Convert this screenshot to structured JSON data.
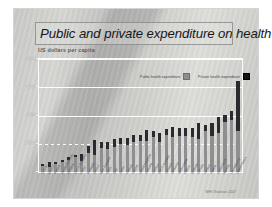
{
  "slide": {
    "title": "Public and private expenditure on health",
    "subtitle": "US dollars per capita",
    "source": "WHO Statistics 2007"
  },
  "legend": {
    "public_label": "Public health expenditure",
    "private_label": "Private health expenditure",
    "public_color": "#8f8f92",
    "private_color": "#2b2b2f",
    "position": "top-right-inside-plot"
  },
  "chart_data": {
    "type": "bar",
    "stacked": true,
    "title": "Public and private expenditure on health",
    "subtitle": "US dollars per capita",
    "xlabel": "",
    "ylabel": "US dollars per capita",
    "ylim": [
      0,
      8000
    ],
    "yticks": [
      0,
      2000,
      4000,
      6000,
      8000
    ],
    "ytick_labels": [
      "0",
      "2000",
      "4000",
      "6000",
      "8000"
    ],
    "grid": true,
    "legend_position": "top right",
    "categories": [
      "Turkey",
      "Mexico",
      "Poland",
      "Slovak Republic",
      "Hungary",
      "Czech Republic",
      "Korea",
      "Portugal",
      "Greece",
      "New Zealand",
      "Spain",
      "Italy",
      "Japan",
      "Finland",
      "Ireland",
      "United Kingdom",
      "Australia",
      "Sweden",
      "OECD average",
      "Denmark",
      "Germany",
      "Netherlands",
      "France",
      "Belgium",
      "Canada",
      "Iceland",
      "Austria",
      "Switzerland",
      "Norway",
      "Luxembourg",
      "United States"
    ],
    "series": [
      {
        "name": "Public health expenditure",
        "color": "#8f8f92",
        "values": [
          440,
          380,
          540,
          690,
          830,
          1060,
          760,
          1320,
          1230,
          1680,
          1650,
          1790,
          1980,
          1900,
          2100,
          2190,
          2210,
          2490,
          2100,
          2650,
          2450,
          2530,
          2580,
          2510,
          2350,
          2880,
          2560,
          2750,
          3520,
          3700,
          2900
        ]
      },
      {
        "name": "Private health expenditure",
        "color": "#2b2b2f",
        "values": [
          150,
          300,
          180,
          180,
          230,
          150,
          540,
          560,
          1030,
          430,
          480,
          560,
          420,
          520,
          540,
          470,
          760,
          390,
          700,
          390,
          760,
          570,
          540,
          640,
          1100,
          480,
          880,
          1150,
          540,
          620,
          3560
        ]
      }
    ],
    "totals": [
      590,
      680,
      720,
      870,
      1060,
      1210,
      1300,
      1880,
      2260,
      2110,
      2130,
      2350,
      2400,
      2420,
      2640,
      2660,
      2970,
      2880,
      2800,
      3040,
      3210,
      3100,
      3120,
      3150,
      3450,
      3360,
      3440,
      3900,
      4060,
      4320,
      6460
    ]
  }
}
